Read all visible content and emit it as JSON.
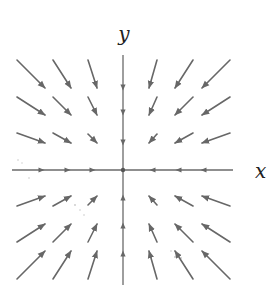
{
  "diagram": {
    "colors": {
      "arrow": "#676767",
      "axis": "#6a6a6a",
      "label": "#222222",
      "background": "#ffffff"
    },
    "axes": {
      "x_label": "x",
      "y_label": "y",
      "origin": [
        123,
        170
      ],
      "x_range_px": [
        12,
        233
      ],
      "y_range_px": [
        55,
        285
      ],
      "x_label_pos": [
        255,
        178
      ],
      "y_label_pos": [
        124,
        41
      ]
    },
    "grid": {
      "columns_px": [
        31,
        62,
        93,
        123,
        152,
        184,
        216
      ],
      "rows_px": [
        73,
        106,
        138,
        170,
        202,
        234,
        266
      ]
    },
    "vectors": [
      {
        "from": [
          17,
          60
        ],
        "to": [
          45,
          88
        ]
      },
      {
        "from": [
          53,
          60
        ],
        "to": [
          71,
          88
        ]
      },
      {
        "from": [
          88,
          60
        ],
        "to": [
          97,
          88
        ]
      },
      {
        "from": [
          157,
          60
        ],
        "to": [
          149,
          88
        ]
      },
      {
        "from": [
          193,
          60
        ],
        "to": [
          175,
          88
        ]
      },
      {
        "from": [
          230,
          60
        ],
        "to": [
          202,
          88
        ]
      },
      {
        "from": [
          17,
          97
        ],
        "to": [
          45,
          115
        ]
      },
      {
        "from": [
          53,
          97
        ],
        "to": [
          71,
          115
        ]
      },
      {
        "from": [
          88,
          97
        ],
        "to": [
          97,
          115
        ]
      },
      {
        "from": [
          157,
          97
        ],
        "to": [
          149,
          115
        ]
      },
      {
        "from": [
          193,
          97
        ],
        "to": [
          175,
          115
        ]
      },
      {
        "from": [
          230,
          97
        ],
        "to": [
          202,
          115
        ]
      },
      {
        "from": [
          17,
          133
        ],
        "to": [
          45,
          143
        ]
      },
      {
        "from": [
          53,
          133
        ],
        "to": [
          71,
          143
        ]
      },
      {
        "from": [
          88,
          134
        ],
        "to": [
          97,
          143
        ]
      },
      {
        "from": [
          157,
          134
        ],
        "to": [
          149,
          143
        ]
      },
      {
        "from": [
          193,
          133
        ],
        "to": [
          175,
          143
        ]
      },
      {
        "from": [
          230,
          133
        ],
        "to": [
          202,
          143
        ]
      },
      {
        "from": [
          17,
          206
        ],
        "to": [
          45,
          196
        ]
      },
      {
        "from": [
          53,
          206
        ],
        "to": [
          71,
          196
        ]
      },
      {
        "from": [
          88,
          205
        ],
        "to": [
          97,
          196
        ]
      },
      {
        "from": [
          157,
          205
        ],
        "to": [
          149,
          196
        ]
      },
      {
        "from": [
          193,
          206
        ],
        "to": [
          175,
          196
        ]
      },
      {
        "from": [
          230,
          206
        ],
        "to": [
          202,
          196
        ]
      },
      {
        "from": [
          17,
          242
        ],
        "to": [
          45,
          224
        ]
      },
      {
        "from": [
          53,
          242
        ],
        "to": [
          71,
          224
        ]
      },
      {
        "from": [
          88,
          242
        ],
        "to": [
          97,
          224
        ]
      },
      {
        "from": [
          157,
          242
        ],
        "to": [
          149,
          224
        ]
      },
      {
        "from": [
          193,
          242
        ],
        "to": [
          175,
          224
        ]
      },
      {
        "from": [
          230,
          242
        ],
        "to": [
          202,
          224
        ]
      },
      {
        "from": [
          17,
          279
        ],
        "to": [
          45,
          251
        ]
      },
      {
        "from": [
          53,
          279
        ],
        "to": [
          71,
          251
        ]
      },
      {
        "from": [
          88,
          279
        ],
        "to": [
          97,
          251
        ]
      },
      {
        "from": [
          157,
          279
        ],
        "to": [
          149,
          251
        ]
      },
      {
        "from": [
          193,
          279
        ],
        "to": [
          175,
          251
        ]
      },
      {
        "from": [
          230,
          279
        ],
        "to": [
          202,
          251
        ]
      }
    ],
    "axis_arrowheads": [
      {
        "at": [
          42,
          170
        ],
        "dir": "right"
      },
      {
        "at": [
          68,
          170
        ],
        "dir": "right"
      },
      {
        "at": [
          93,
          170
        ],
        "dir": "right"
      },
      {
        "at": [
          152,
          170
        ],
        "dir": "left"
      },
      {
        "at": [
          178,
          170
        ],
        "dir": "left"
      },
      {
        "at": [
          203,
          170
        ],
        "dir": "left"
      },
      {
        "at": [
          123,
          88
        ],
        "dir": "down"
      },
      {
        "at": [
          123,
          113
        ],
        "dir": "down"
      },
      {
        "at": [
          123,
          143
        ],
        "dir": "down"
      },
      {
        "at": [
          123,
          197
        ],
        "dir": "up"
      },
      {
        "at": [
          123,
          225
        ],
        "dir": "up"
      },
      {
        "at": [
          123,
          253
        ],
        "dir": "up"
      }
    ]
  }
}
